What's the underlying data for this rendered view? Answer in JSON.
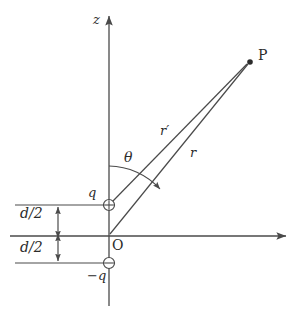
{
  "figure": {
    "kind": "physics-diagram",
    "background_color": "#ffffff",
    "stroke_color": "#4a4a4a",
    "text_color": "#2b2b2b"
  },
  "axes": {
    "vertical": {
      "label": "z",
      "name": "z-axis",
      "x": 109,
      "y_top": 14,
      "y_bottom": 306,
      "arrow_at": "top"
    },
    "horizontal": {
      "label": "",
      "name": "x-axis",
      "y": 236,
      "x_left": 10,
      "x_right": 288,
      "arrow_at": "right"
    }
  },
  "origin": {
    "label": "O",
    "x": 109,
    "y": 236
  },
  "charges": [
    {
      "name": "positive-charge",
      "label": "q",
      "sign": "+",
      "x": 109,
      "y": 205,
      "radius": 5.5
    },
    {
      "name": "negative-charge",
      "label": "−q",
      "sign": "−",
      "x": 109,
      "y": 263,
      "radius": 5.5
    }
  ],
  "field_point": {
    "label": "P",
    "x": 250,
    "y": 62
  },
  "distances": [
    {
      "name": "r-prime",
      "label": "r′",
      "from": "positive-charge",
      "to": "P",
      "label_x": 163,
      "label_y": 130
    },
    {
      "name": "r",
      "label": "r",
      "from": "origin",
      "to": "P",
      "label_x": 192,
      "label_y": 153
    }
  ],
  "angle": {
    "name": "theta",
    "label": "θ",
    "label_x": 125,
    "label_y": 157,
    "vertex_x": 109,
    "vertex_y": 236,
    "from_axis": "z",
    "to_line": "r"
  },
  "dimensions": [
    {
      "name": "upper-half-separation",
      "label": "d/2",
      "label_x": 22,
      "label_y": 212,
      "from_y": 205,
      "to_y": 236,
      "line_x": 58
    },
    {
      "name": "lower-half-separation",
      "label": "d/2",
      "label_x": 22,
      "label_y": 245,
      "from_y": 236,
      "to_y": 263,
      "line_x": 58
    }
  ],
  "guide_lines": [
    {
      "name": "guide-upper",
      "y": 205,
      "x_start": 15,
      "x_end": 105
    },
    {
      "name": "guide-lower",
      "y": 263,
      "x_start": 15,
      "x_end": 105
    }
  ]
}
